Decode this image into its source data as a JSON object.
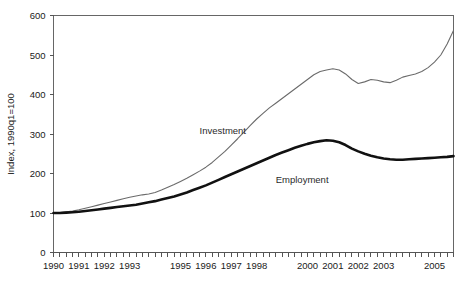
{
  "chart_data": {
    "type": "line",
    "title": "",
    "xlabel": "",
    "ylabel": "Index, 1990q1=100",
    "ylim": [
      0,
      600
    ],
    "yticks": [
      0,
      100,
      200,
      300,
      400,
      500,
      600
    ],
    "ytick_labels": [
      "0",
      "100",
      "200",
      "300",
      "400",
      "500",
      "600"
    ],
    "xlim": [
      "1990q1",
      "2005q4"
    ],
    "xtick_labels": [
      "1990",
      "1991",
      "1992",
      "1993",
      "1995",
      "1996",
      "1997",
      "1998",
      "2000",
      "2001",
      "2002",
      "2003",
      "2005"
    ],
    "xtick_label_quarters": [
      0,
      4,
      8,
      12,
      20,
      24,
      28,
      32,
      40,
      44,
      48,
      52,
      60
    ],
    "xtick_minor_count": 64,
    "xtick_minor_interval_quarters": 1,
    "grid": false,
    "legend_position": "inline-annotation",
    "x": [
      "1990q1",
      "1990q2",
      "1990q3",
      "1990q4",
      "1991q1",
      "1991q2",
      "1991q3",
      "1991q4",
      "1992q1",
      "1992q2",
      "1992q3",
      "1992q4",
      "1993q1",
      "1993q2",
      "1993q3",
      "1993q4",
      "1994q1",
      "1994q2",
      "1994q3",
      "1994q4",
      "1995q1",
      "1995q2",
      "1995q3",
      "1995q4",
      "1996q1",
      "1996q2",
      "1996q3",
      "1996q4",
      "1997q1",
      "1997q2",
      "1997q3",
      "1997q4",
      "1998q1",
      "1998q2",
      "1998q3",
      "1998q4",
      "1999q1",
      "1999q2",
      "1999q3",
      "1999q4",
      "2000q1",
      "2000q2",
      "2000q3",
      "2000q4",
      "2001q1",
      "2001q2",
      "2001q3",
      "2001q4",
      "2002q1",
      "2002q2",
      "2002q3",
      "2002q4",
      "2003q1",
      "2003q2",
      "2003q3",
      "2003q4",
      "2004q1",
      "2004q2",
      "2004q3",
      "2004q4",
      "2005q1",
      "2005q2",
      "2005q3",
      "2005q4"
    ],
    "series": [
      {
        "name": "Investment",
        "color": "#6b6b6b",
        "line_width": 1.1,
        "annotation_label": "Investment",
        "values": [
          100,
          101,
          103,
          105,
          108,
          112,
          116,
          120,
          124,
          128,
          132,
          136,
          140,
          143,
          146,
          148,
          152,
          158,
          165,
          172,
          180,
          188,
          197,
          206,
          216,
          228,
          242,
          256,
          272,
          288,
          305,
          322,
          338,
          352,
          366,
          378,
          390,
          402,
          414,
          426,
          438,
          450,
          458,
          462,
          465,
          462,
          452,
          438,
          428,
          432,
          438,
          436,
          432,
          430,
          436,
          444,
          448,
          452,
          458,
          468,
          482,
          500,
          528,
          562
        ]
      },
      {
        "name": "Employment",
        "color": "#111111",
        "line_width": 2.6,
        "annotation_label": "Employment",
        "values": [
          100,
          100,
          101,
          102,
          103,
          105,
          107,
          109,
          111,
          113,
          115,
          117,
          119,
          121,
          124,
          127,
          130,
          134,
          138,
          142,
          147,
          152,
          158,
          164,
          170,
          177,
          184,
          191,
          198,
          205,
          212,
          219,
          226,
          233,
          240,
          247,
          253,
          259,
          265,
          270,
          275,
          279,
          282,
          284,
          283,
          279,
          272,
          263,
          256,
          250,
          245,
          241,
          238,
          236,
          235,
          235,
          236,
          237,
          238,
          239,
          240,
          241,
          242,
          244
        ]
      }
    ],
    "annotations": [
      {
        "text": "Investment",
        "x_quarter": 23,
        "y_value": 300
      },
      {
        "text": "Employment",
        "x_quarter": 35,
        "y_value": 175
      }
    ]
  }
}
